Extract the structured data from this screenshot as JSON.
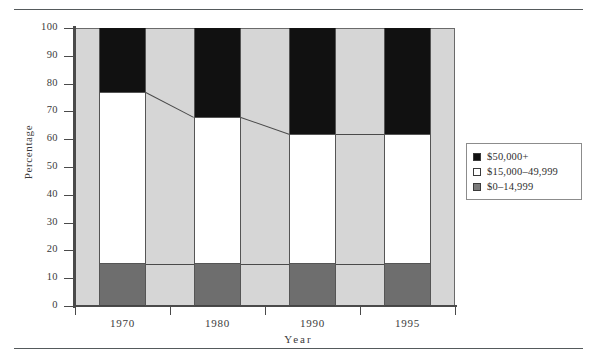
{
  "figure": {
    "clipped_caption": "",
    "background": "#ffffff",
    "plot_background": "#d6d6d6"
  },
  "legend": {
    "position": "right",
    "entries": [
      {
        "label": "$50,000+",
        "color": "#111111",
        "key": "high"
      },
      {
        "label": "$15,000–49,999",
        "color": "#ffffff",
        "key": "mid"
      },
      {
        "label": "$0–14,999",
        "color": "#7a7a7a",
        "key": "low"
      }
    ]
  },
  "chart_data": {
    "type": "bar",
    "subtype": "stacked-percentage-column",
    "title": "",
    "xlabel": "Year",
    "ylabel": "Percentage",
    "categories": [
      "1970",
      "1980",
      "1990",
      "1995"
    ],
    "ylim": [
      0,
      100
    ],
    "yticks": [
      0,
      10,
      20,
      30,
      40,
      50,
      60,
      70,
      80,
      90,
      100
    ],
    "ytick_labels": [
      "0",
      "10",
      "20",
      "30",
      "40",
      "50",
      "60",
      "70",
      "80",
      "90",
      "100"
    ],
    "grid": false,
    "stack_order_bottom_to_top": [
      "$0–14,999",
      "$15,000–49,999",
      "$50,000+"
    ],
    "series": [
      {
        "name": "$0–14,999",
        "color": "#6e6e6e",
        "values": [
          15,
          15,
          15,
          15
        ]
      },
      {
        "name": "$15,000–49,999",
        "color": "#ffffff",
        "values": [
          62,
          53,
          47,
          47
        ]
      },
      {
        "name": "$50,000+",
        "color": "#111111",
        "values": [
          23,
          32,
          38,
          38
        ]
      }
    ],
    "cumulative_tops": {
      "low": [
        15,
        15,
        15,
        15
      ],
      "mid": [
        77,
        68,
        62,
        62
      ],
      "high": [
        100,
        100,
        100,
        100
      ]
    },
    "annotations": [
      {
        "type": "connector-line",
        "from_category": "1970",
        "to_category": "1980",
        "from_value": 77,
        "to_value": 68
      },
      {
        "type": "connector-line",
        "from_category": "1980",
        "to_category": "1990",
        "from_value": 68,
        "to_value": 62
      },
      {
        "type": "connector-line",
        "from_category": "1990",
        "to_category": "1995",
        "from_value": 62,
        "to_value": 62
      },
      {
        "type": "connector-line",
        "from_category": "1970",
        "to_category": "1980",
        "from_value": 15,
        "to_value": 15
      },
      {
        "type": "connector-line",
        "from_category": "1980",
        "to_category": "1990",
        "from_value": 15,
        "to_value": 15
      },
      {
        "type": "connector-line",
        "from_category": "1990",
        "to_category": "1995",
        "from_value": 15,
        "to_value": 15
      }
    ]
  }
}
